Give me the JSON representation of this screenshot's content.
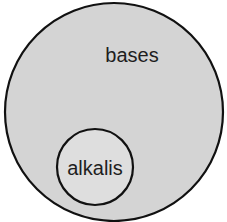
{
  "diagram": {
    "type": "venn-subset",
    "outer_set": {
      "label": "bases",
      "fill": "#d4d4d4",
      "stroke": "#111111"
    },
    "inner_set": {
      "label": "alkalis",
      "fill": "#dedede",
      "stroke": "#111111"
    }
  }
}
